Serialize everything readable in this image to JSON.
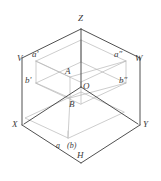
{
  "figure": {
    "type": "orthographic-projection-diagram",
    "width": 161,
    "height": 181,
    "background_color": "#ffffff",
    "axis_line_color": "#3c3c3c",
    "construction_line_color": "#b6b6b6",
    "label_color": "#3a3a3a"
  },
  "labels": {
    "axis_z": "Z",
    "axis_x": "X",
    "axis_y": "Y",
    "plane_v": "V",
    "plane_h": "H",
    "plane_w": "W",
    "origin": "O",
    "point_a": "A",
    "point_b": "B",
    "proj_a_front": "a'",
    "proj_b_front": "b'",
    "proj_a_side": "a″",
    "proj_b_side": "b″",
    "proj_a_top": "a",
    "proj_b_top": "(b)"
  },
  "geometry": {
    "origin": {
      "x": 81,
      "y": 87
    },
    "z_apex": {
      "x": 81,
      "y": 27
    },
    "x_corner": {
      "x": 22,
      "y": 125
    },
    "y_corner": {
      "x": 140,
      "y": 125
    },
    "h_bottom": {
      "x": 81,
      "y": 163
    },
    "v_top_left": {
      "x": 22,
      "y": 58
    },
    "w_top_right": {
      "x": 140,
      "y": 58
    },
    "point_a_3d": {
      "x": 70,
      "y": 77
    },
    "point_b_3d": {
      "x": 70,
      "y": 98
    },
    "proj_a_top_point": {
      "x": 68,
      "y": 138
    },
    "proj_a_front_point": {
      "x": 36,
      "y": 61
    },
    "proj_b_front_point": {
      "x": 36,
      "y": 83
    },
    "proj_a_side_point": {
      "x": 126,
      "y": 61
    },
    "proj_b_side_point": {
      "x": 126,
      "y": 83
    }
  }
}
